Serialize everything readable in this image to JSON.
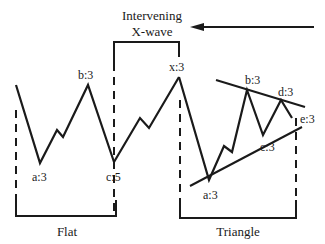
{
  "title": {
    "line1": "Intervening",
    "line2": "X-wave"
  },
  "arrow": {
    "direction": "left",
    "icon": "left-arrow-icon"
  },
  "labels": {
    "flat_a": "a:3",
    "flat_b": "b:3",
    "flat_c": "c:5",
    "x": "x:3",
    "tri_a": "a:3",
    "tri_b": "b:3",
    "tri_c": "c:3",
    "tri_d": "d:3",
    "tri_e": "e:3"
  },
  "groups": {
    "flat": "Flat",
    "triangle": "Triangle"
  },
  "colors": {
    "stroke": "#1a1a1a",
    "background": "#ffffff"
  }
}
